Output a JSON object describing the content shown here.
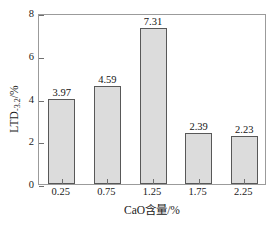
{
  "chart_data": {
    "type": "bar",
    "title": "",
    "xlabel": "CaO含量/%",
    "ylabel_main": "LTD",
    "ylabel_sub": "-3.2",
    "ylabel_unit": "/%",
    "ylabel_full": "LTD-3.2/%",
    "categories": [
      "0.25",
      "0.75",
      "1.25",
      "1.75",
      "2.25"
    ],
    "values": [
      3.97,
      4.59,
      7.31,
      2.39,
      2.23
    ],
    "value_labels": [
      "3.97",
      "4.59",
      "7.31",
      "2.39",
      "2.23"
    ],
    "ylim": [
      0,
      8
    ],
    "yticks": [
      0,
      2,
      4,
      6,
      8
    ],
    "ytick_labels": [
      "0",
      "2",
      "4",
      "6",
      "8"
    ],
    "grid": false,
    "legend": null,
    "bar_fill_color": "#dcdcdc",
    "bar_edge_color": "#585858",
    "frame_color": "#9b9b9b",
    "background_color": "#ffffff",
    "text_color": "#141414"
  }
}
